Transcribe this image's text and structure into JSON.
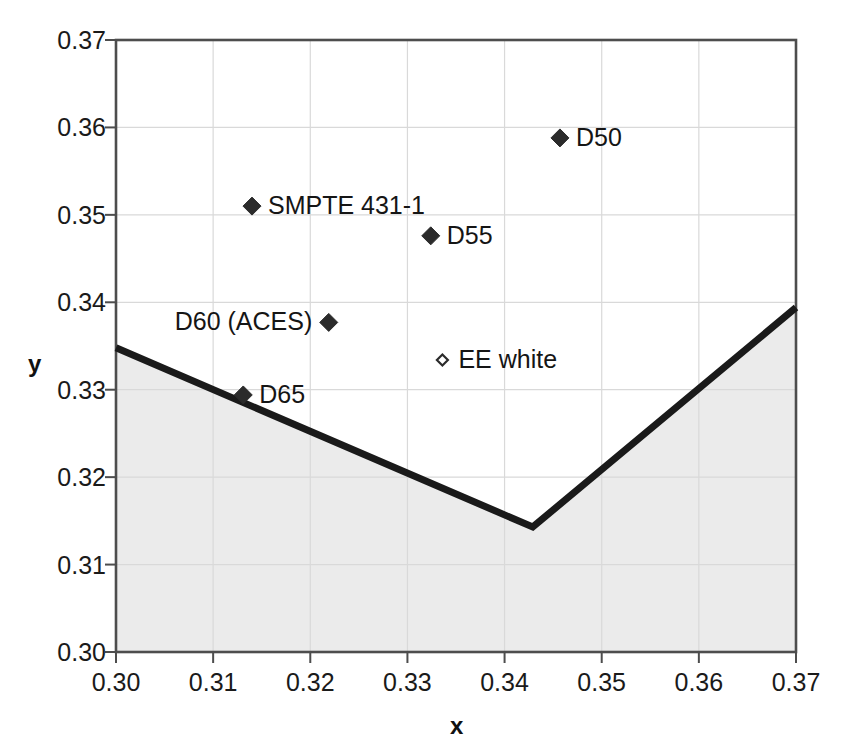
{
  "chart_data": {
    "type": "scatter",
    "title": "",
    "xlabel": "x",
    "ylabel": "y",
    "xlim": [
      0.3,
      0.37
    ],
    "ylim": [
      0.3,
      0.37
    ],
    "grid": true,
    "legend": "none",
    "xticks": [
      "0.30",
      "0.31",
      "0.32",
      "0.33",
      "0.34",
      "0.35",
      "0.36",
      "0.37"
    ],
    "yticks": [
      "0.30",
      "0.31",
      "0.32",
      "0.33",
      "0.34",
      "0.35",
      "0.36",
      "0.37"
    ],
    "xtick_values": [
      0.3,
      0.31,
      0.32,
      0.33,
      0.34,
      0.35,
      0.36,
      0.37
    ],
    "ytick_values": [
      0.3,
      0.31,
      0.32,
      0.33,
      0.34,
      0.35,
      0.36,
      0.37
    ],
    "points": [
      {
        "name": "D50",
        "x": 0.3457,
        "y": 0.3588,
        "label": "D50",
        "label_side": "right",
        "marker": "filled-diamond"
      },
      {
        "name": "SMPTE 431-1",
        "x": 0.314,
        "y": 0.351,
        "label": "SMPTE 431-1",
        "label_side": "right",
        "marker": "filled-diamond"
      },
      {
        "name": "D55",
        "x": 0.3324,
        "y": 0.3476,
        "label": "D55",
        "label_side": "right",
        "marker": "filled-diamond"
      },
      {
        "name": "D60 (ACES)",
        "x": 0.3219,
        "y": 0.3377,
        "label": "D60 (ACES)",
        "label_side": "left",
        "marker": "filled-diamond"
      },
      {
        "name": "EE white",
        "x": 0.3336,
        "y": 0.3334,
        "label": "EE white",
        "label_side": "right",
        "marker": "hollow-diamond"
      },
      {
        "name": "D65",
        "x": 0.3131,
        "y": 0.3294,
        "label": "D65",
        "label_side": "right",
        "marker": "filled-diamond"
      }
    ],
    "series": [
      {
        "name": "boundary-curve",
        "type": "line",
        "fill": "shaded-below",
        "x": [
          0.3,
          0.3429,
          0.37
        ],
        "y": [
          0.3348,
          0.3143,
          0.3394
        ]
      }
    ],
    "colors": {
      "line": "#1a1a1a",
      "fill": "#ebebeb",
      "grid": "#d9d9d9",
      "axis": "#4d4d4d",
      "marker": "#2b2b2b",
      "text": "#151515"
    }
  },
  "axes": {
    "x_title": "x",
    "y_title": "y"
  }
}
